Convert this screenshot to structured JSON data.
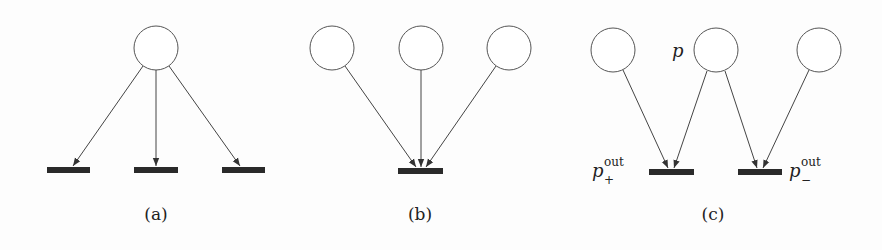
{
  "figure": {
    "panels": [
      {
        "id": "a",
        "caption": "(a)",
        "places": 1,
        "transitions": 3,
        "description": "one place with arcs to three transitions"
      },
      {
        "id": "b",
        "caption": "(b)",
        "places": 3,
        "transitions": 1,
        "description": "three places with arcs to one transition"
      },
      {
        "id": "c",
        "caption": "(c)",
        "places": 3,
        "transitions": 2,
        "description": "place p feeds two output transitions p_+^out and p_-^out",
        "labels": {
          "p": "p",
          "p_plus_base": "p",
          "p_plus_sup": "out",
          "p_plus_sub": "+",
          "p_minus_base": "p",
          "p_minus_sup": "out",
          "p_minus_sub": "−"
        }
      }
    ]
  }
}
